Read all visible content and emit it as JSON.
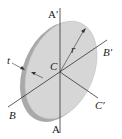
{
  "diagram": {
    "colors": {
      "disk_face": "#d4d4d4",
      "disk_rim": "#b8b8b8",
      "lines": "#333333"
    },
    "labels": {
      "a_prime": "A′",
      "a": "A",
      "b": "B",
      "b_prime": "B′",
      "c": "C",
      "c_prime": "C′",
      "r": "r",
      "t": "t"
    }
  }
}
